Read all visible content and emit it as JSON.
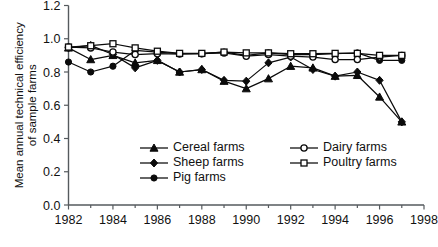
{
  "chart_data": {
    "type": "line",
    "title": "",
    "xlabel": "",
    "ylabel": "Mean annual technical efficiency of sample farms",
    "ylabel_line1": "Mean annual technical efficiency",
    "ylabel_line2": "of sample farms",
    "xlim": [
      1982,
      1998
    ],
    "ylim": [
      0.0,
      1.2
    ],
    "ytick_labels": [
      "0.0",
      "0.2",
      "0.4",
      "0.6",
      "0.8",
      "1.0",
      "1.2"
    ],
    "yticks": [
      0.0,
      0.2,
      0.4,
      0.6,
      0.8,
      1.0,
      1.2
    ],
    "xtick_labels": [
      "1982",
      "1984",
      "1986",
      "1988",
      "1990",
      "1992",
      "1994",
      "1996",
      "1998"
    ],
    "xticks": [
      1982,
      1984,
      1986,
      1988,
      1990,
      1992,
      1994,
      1996,
      1998
    ],
    "x_minor_ticks": [
      1983,
      1985,
      1987,
      1989,
      1991,
      1993,
      1995,
      1997
    ],
    "grid": false,
    "legend_position": "inside-lower-center",
    "x": [
      1982,
      1983,
      1984,
      1985,
      1986,
      1987,
      1988,
      1989,
      1990,
      1991,
      1992,
      1993,
      1994,
      1995,
      1996,
      1997
    ],
    "series": [
      {
        "name": "Cereal farms",
        "marker": "filled-triangle",
        "color": "#0b0b0b",
        "values": [
          0.945,
          0.875,
          0.9,
          0.855,
          0.87,
          0.8,
          0.815,
          0.745,
          0.7,
          0.76,
          0.835,
          0.825,
          0.775,
          0.78,
          0.65,
          0.5
        ]
      },
      {
        "name": "Sheep farms",
        "marker": "filled-diamond",
        "color": "#0b0b0b",
        "values": [
          0.945,
          0.96,
          0.905,
          0.825,
          0.87,
          0.8,
          0.815,
          0.75,
          0.745,
          0.855,
          0.89,
          0.815,
          0.775,
          0.8,
          0.75,
          0.5
        ]
      },
      {
        "name": "Pig farms",
        "marker": "filled-circle",
        "color": "#0b0b0b",
        "values": [
          0.86,
          0.8,
          0.835,
          0.93,
          0.92,
          0.91,
          0.91,
          0.92,
          0.9,
          0.915,
          0.905,
          0.905,
          0.91,
          0.915,
          0.87,
          0.87
        ]
      },
      {
        "name": "Dairy farms",
        "marker": "open-circle",
        "color": "#0b0b0b",
        "values": [
          0.95,
          0.945,
          0.92,
          0.905,
          0.91,
          0.908,
          0.91,
          0.915,
          0.895,
          0.905,
          0.895,
          0.89,
          0.875,
          0.875,
          0.89,
          0.9
        ]
      },
      {
        "name": "Poultry farms",
        "marker": "open-square",
        "color": "#0b0b0b",
        "values": [
          0.95,
          0.958,
          0.97,
          0.945,
          0.925,
          0.912,
          0.912,
          0.92,
          0.915,
          0.915,
          0.91,
          0.91,
          0.912,
          0.912,
          0.9,
          0.9
        ]
      }
    ],
    "legend": [
      {
        "label": "Cereal farms",
        "marker": "filled-triangle"
      },
      {
        "label": "Sheep farms",
        "marker": "filled-diamond"
      },
      {
        "label": "Pig farms",
        "marker": "filled-circle"
      },
      {
        "label": "Dairy farms",
        "marker": "open-circle"
      },
      {
        "label": "Poultry farms",
        "marker": "open-square"
      }
    ]
  }
}
